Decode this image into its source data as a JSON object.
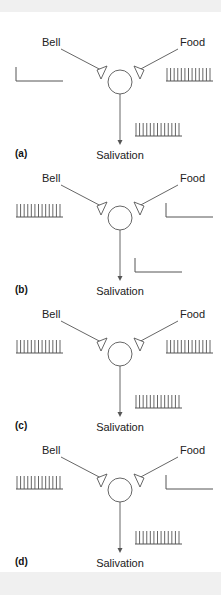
{
  "figure": {
    "panels": [
      {
        "id": "a",
        "label": "(a)",
        "left_input": "Bell",
        "right_input": "Food",
        "output": "Salivation",
        "left_activity": "silent",
        "right_activity": "firing",
        "output_activity": "firing"
      },
      {
        "id": "b",
        "label": "(b)",
        "left_input": "Bell",
        "right_input": "Food",
        "output": "Salivation",
        "left_activity": "firing",
        "right_activity": "silent",
        "output_activity": "silent"
      },
      {
        "id": "c",
        "label": "(c)",
        "left_input": "Bell",
        "right_input": "Food",
        "output": "Salivation",
        "left_activity": "firing",
        "right_activity": "firing",
        "output_activity": "firing"
      },
      {
        "id": "d",
        "label": "(d)",
        "left_input": "Bell",
        "right_input": "Food",
        "output": "Salivation",
        "left_activity": "firing",
        "right_activity": "silent",
        "output_activity": "firing"
      }
    ],
    "colors": {
      "line": "#555555",
      "text": "#222222",
      "label": "#111111"
    }
  }
}
